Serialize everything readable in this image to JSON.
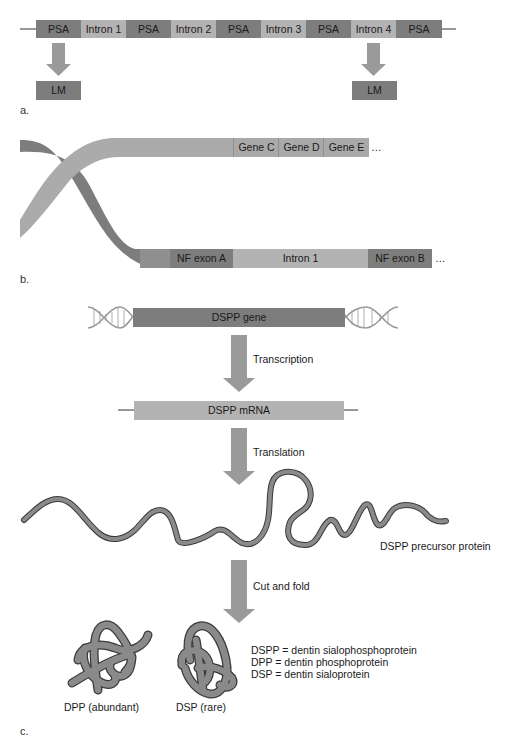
{
  "colors": {
    "exon_dark": "#7d7d7d",
    "intron_light": "#b3b3b3",
    "arrow": "#9a9a9a",
    "protein": "#8a8a8a",
    "protein_outline": "#3a3a3a",
    "background": "#ffffff"
  },
  "panel_a": {
    "label": "a.",
    "segments": [
      {
        "label": "PSA",
        "type": "exon"
      },
      {
        "label": "Intron 1",
        "type": "intron"
      },
      {
        "label": "PSA",
        "type": "exon"
      },
      {
        "label": "Intron 2",
        "type": "intron"
      },
      {
        "label": "PSA",
        "type": "exon"
      },
      {
        "label": "Intron 3",
        "type": "intron"
      },
      {
        "label": "PSA",
        "type": "exon"
      },
      {
        "label": "Intron 4",
        "type": "intron"
      },
      {
        "label": "PSA",
        "type": "exon"
      }
    ],
    "products": [
      {
        "label": "LM",
        "from_segment": 0
      },
      {
        "label": "LM",
        "from_segment": 7
      }
    ]
  },
  "panel_b": {
    "label": "b.",
    "top_strand": {
      "genes": [
        "Gene C",
        "Gene D",
        "Gene E"
      ],
      "continuation": "…"
    },
    "bottom_strand": {
      "segments": [
        "NF exon A",
        "Intron 1",
        "NF exon B"
      ],
      "continuation": "…"
    }
  },
  "panel_c": {
    "label": "c.",
    "gene_label": "DSPP gene",
    "step1": "Transcription",
    "mrna_label": "DSPP mRNA",
    "step2": "Translation",
    "precursor_label": "DSPP precursor protein",
    "step3": "Cut and fold",
    "products": [
      {
        "label": "DPP (abundant)"
      },
      {
        "label": "DSP (rare)"
      }
    ],
    "legend": [
      "DSPP = dentin sialophosphoprotein",
      "DPP = dentin phosphoprotein",
      "DSP = dentin sialoprotein"
    ]
  }
}
